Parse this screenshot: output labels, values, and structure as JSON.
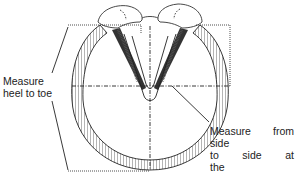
{
  "diagram": {
    "colors": {
      "line": "#222222",
      "wall_fill": "#ffffff",
      "background": "#ffffff"
    },
    "parts": [
      "heel bulbs",
      "hoof wall",
      "bars",
      "frog",
      "sole"
    ],
    "measurements": [
      {
        "id": "heel-to-toe",
        "line_style": "dotted bracket + dash-dot center line"
      },
      {
        "id": "side-to-side",
        "line_style": "dash-dot horizontal line at widest point"
      }
    ]
  },
  "labels": {
    "heel_to_toe": {
      "line1": "Measure",
      "line2": "heel to toe"
    },
    "side_to_side": {
      "line1": "Measure from side",
      "line2": "to side at the",
      "line3": "widest point"
    }
  }
}
